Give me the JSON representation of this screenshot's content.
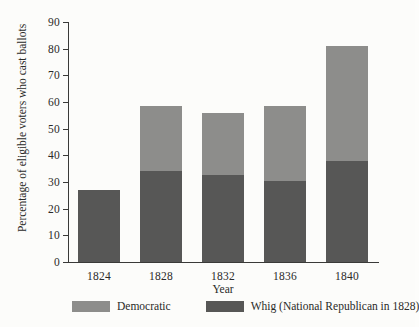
{
  "chart_data": {
    "type": "bar",
    "subtype": "stacked-bar",
    "title": "",
    "xlabel": "Year",
    "ylabel": "Percentage of eligible voters who cast ballots",
    "categories": [
      "1824",
      "1828",
      "1832",
      "1836",
      "1840"
    ],
    "ylim": [
      0,
      90
    ],
    "ytick_labels": [
      "0",
      "10",
      "20",
      "30",
      "40",
      "50",
      "60",
      "70",
      "80",
      "90"
    ],
    "ytick_values": [
      0,
      10,
      20,
      30,
      40,
      50,
      60,
      70,
      80,
      90
    ],
    "grid": false,
    "legend_position": "bottom",
    "series": [
      {
        "name": "Whig (National Republican in 1828)",
        "color": "#575756",
        "values": [
          27,
          34,
          32.5,
          30.5,
          38
        ]
      },
      {
        "name": "Democratic",
        "color": "#8d8d8b",
        "values": [
          0,
          24.5,
          23.5,
          28,
          43
        ]
      }
    ],
    "totals": [
      27,
      58.5,
      56,
      58.5,
      81
    ],
    "stack_order_bottom_to_top": [
      "Whig (National Republican in 1828)",
      "Democratic"
    ]
  },
  "legend": {
    "items": [
      {
        "label": "Democratic",
        "color": "#8d8d8b"
      },
      {
        "label": "Whig (National Republican in 1828)",
        "color": "#575756"
      }
    ]
  },
  "axes": {
    "x_title": "Year",
    "y_title": "Percentage of eligible voters who cast ballots"
  }
}
